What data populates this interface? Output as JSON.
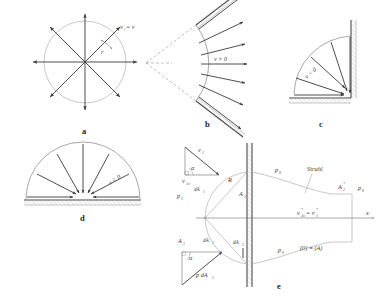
{
  "figure": {
    "panels": [
      {
        "id": "a",
        "letter": "a",
        "labels": {
          "velocity": "v",
          "velocity_sub": "i",
          "velocity_equals": "= v",
          "radius": "r"
        }
      },
      {
        "id": "b",
        "letter": "b",
        "labels": {
          "flow": "v > 0"
        }
      },
      {
        "id": "c",
        "letter": "c",
        "labels": {
          "flow": "v < 0"
        }
      },
      {
        "id": "d",
        "letter": "d",
        "labels": {
          "flow": "v < 0"
        }
      },
      {
        "id": "e",
        "letter": "e",
        "labels": {
          "v1": "v",
          "v1_sub": "1",
          "v1x": "v",
          "v1x_sub": "1x",
          "alpha_top": "α",
          "alpha_bottom": "α",
          "p1": "p",
          "p1_sub": "1",
          "dA1_top": "dA",
          "dA1_top_sub": "1",
          "dA1_bottom": "dA",
          "dA1_bottom_sub": "1",
          "dA2": "dA",
          "dA2_sub": "2",
          "A1": "A",
          "A1_sub": "1",
          "A2": "A",
          "A2_sub": "2",
          "A2_star": "A",
          "A2_star_sub": "2",
          "A2_star_sup": "*",
          "R": "R",
          "p0_top": "p",
          "p0_top_sub": "0",
          "p0_bottom": "p",
          "p0_bottom_sub": "0",
          "p0_right": "p",
          "p0_right_sub": "0",
          "jet": "Strahl",
          "v2x_star": "v",
          "v2x_star_sub": "2x",
          "v2x_star_sup": "*",
          "v2x_star_eq": "= v",
          "v1_star_sub": "1",
          "v1_star_sup": "*",
          "reference": "(0) ≡ (A)",
          "pressure_force": "p dA",
          "pressure_force_sub": "1",
          "axis_x": "x"
        }
      }
    ],
    "colors": {
      "line": "#3a3a3a",
      "thin_line": "#6b6b6b",
      "faint_line": "#9a9a9a",
      "wall": "#4a4a4a",
      "text": "#2e2e2e",
      "background": "#ffffff"
    }
  }
}
